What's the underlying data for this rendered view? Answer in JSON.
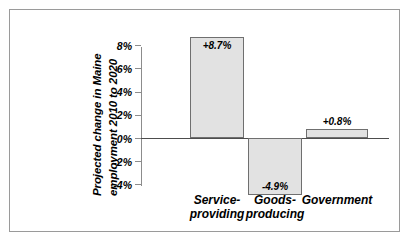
{
  "chart_data": {
    "type": "bar",
    "title": "",
    "xlabel": "",
    "ylabel_line1": "Projected change in Maine",
    "ylabel_line2": "employment 2010 to 2020",
    "categories": [
      "Service-\nproviding",
      "Goods-\nproducing",
      "Government"
    ],
    "values": [
      8.7,
      -4.9,
      0.8
    ],
    "data_labels": [
      "+8.7%",
      "-4.9%",
      "+0.8%"
    ],
    "ytick_labels": [
      "8%",
      "6%",
      "4%",
      "2%",
      "0%",
      "-2%",
      "-4%"
    ],
    "ytick_values": [
      8,
      6,
      4,
      2,
      0,
      -2,
      -4
    ],
    "ylim": [
      -4.8,
      9.0
    ],
    "grid": false,
    "legend": false,
    "bar_fill_color": "#e2e2e2",
    "bar_edge_color": "#6f6f6f",
    "zero_line_color": "#4d4d4d",
    "axis_color": "#8c8c8c",
    "frame_color": "#9a9a9a",
    "background_color": "#ffffff"
  }
}
